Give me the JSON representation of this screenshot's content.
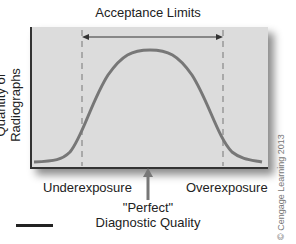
{
  "title": "Acceptance Limits",
  "y_axis_label": "Quantity of Radiographs",
  "left_label": "Underexposure",
  "right_label": "Overexposure",
  "center_label_line1": "\"Perfect\"",
  "center_label_line2": "Diagnostic Quality",
  "copyright": "© Cengage Learning 2013",
  "colors": {
    "panel": "#dcdcdc",
    "curve": "#777777",
    "axis": "#333333"
  }
}
